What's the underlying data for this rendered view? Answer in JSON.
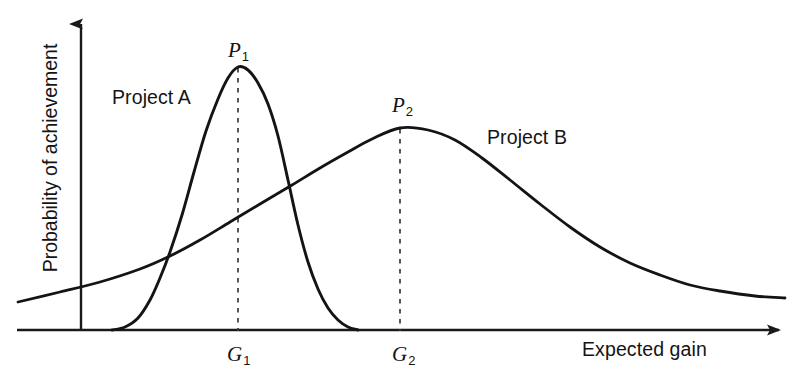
{
  "chart_data": {
    "type": "line",
    "title": "",
    "subtitle": "",
    "xlabel": "Expected gain",
    "ylabel": "Probability of achievement",
    "grid": false,
    "legend_position": "inline-annotations",
    "axes": {
      "x_axis_arrow": true,
      "y_axis_arrow": true,
      "x_ticks": [
        "G1",
        "G2"
      ],
      "y_ticks": [],
      "xlim": [
        0,
        100
      ],
      "ylim": [
        0,
        100
      ]
    },
    "annotations": [
      {
        "name": "peak-a",
        "text": "P",
        "subscript": "1",
        "x": 238,
        "y": 50
      },
      {
        "name": "peak-b",
        "text": "P",
        "subscript": "2",
        "x": 402,
        "y": 105
      },
      {
        "name": "gain-a",
        "text": "G",
        "subscript": "1",
        "x": 237,
        "y": 355
      },
      {
        "name": "gain-b",
        "text": "G",
        "subscript": "2",
        "x": 402,
        "y": 355
      }
    ],
    "dashed_guides": [
      {
        "name": "guide-p1-g1",
        "x": 238,
        "y_top": 68,
        "y_bottom": 330
      },
      {
        "name": "guide-p2-g2",
        "x": 400,
        "y_top": 129,
        "y_bottom": 330
      }
    ],
    "series": [
      {
        "name": "Project A",
        "label": "Project A",
        "description": "Narrow, tall probability distribution peaking at G1",
        "peak_label": "P1",
        "mode_label": "G1",
        "peak_x": 238,
        "peak_y": 67,
        "color": "#141414",
        "values": [
          [
            112,
            330
          ],
          [
            125,
            327
          ],
          [
            138,
            318
          ],
          [
            150,
            300
          ],
          [
            160,
            278
          ],
          [
            170,
            252
          ],
          [
            182,
            215
          ],
          [
            194,
            172
          ],
          [
            206,
            131
          ],
          [
            218,
            99
          ],
          [
            228,
            78
          ],
          [
            238,
            67
          ],
          [
            248,
            70
          ],
          [
            258,
            83
          ],
          [
            268,
            104
          ],
          [
            278,
            136
          ],
          [
            288,
            180
          ],
          [
            298,
            225
          ],
          [
            308,
            262
          ],
          [
            318,
            289
          ],
          [
            328,
            308
          ],
          [
            338,
            320
          ],
          [
            348,
            327
          ],
          [
            358,
            330
          ]
        ]
      },
      {
        "name": "Project B",
        "label": "Project B",
        "description": "Broad, flatter probability distribution peaking at G2",
        "peak_label": "P2",
        "mode_label": "G2",
        "peak_x": 400,
        "peak_y": 128,
        "color": "#141414",
        "values": [
          [
            18,
            302
          ],
          [
            60,
            292
          ],
          [
            100,
            282
          ],
          [
            140,
            269
          ],
          [
            170,
            256
          ],
          [
            200,
            240
          ],
          [
            230,
            222
          ],
          [
            260,
            204
          ],
          [
            292,
            185
          ],
          [
            320,
            168
          ],
          [
            348,
            152
          ],
          [
            372,
            139
          ],
          [
            400,
            128
          ],
          [
            428,
            130
          ],
          [
            455,
            140
          ],
          [
            482,
            158
          ],
          [
            510,
            180
          ],
          [
            540,
            204
          ],
          [
            570,
            227
          ],
          [
            600,
            247
          ],
          [
            630,
            263
          ],
          [
            660,
            275
          ],
          [
            690,
            285
          ],
          [
            720,
            291
          ],
          [
            755,
            296
          ],
          [
            785,
            298
          ]
        ]
      }
    ]
  },
  "labels": {
    "series_a": "Project A",
    "series_b": "Project B",
    "x_axis": "Expected gain",
    "y_axis": "Probability of achievement",
    "p1_base": "P",
    "p1_sub": "1",
    "p2_base": "P",
    "p2_sub": "2",
    "g1_base": "G",
    "g1_sub": "1",
    "g2_base": "G",
    "g2_sub": "2"
  },
  "colors": {
    "background": "#ffffff",
    "ink": "#141414",
    "axis": "#1a1a1a",
    "dash": "#3a3a3a"
  }
}
